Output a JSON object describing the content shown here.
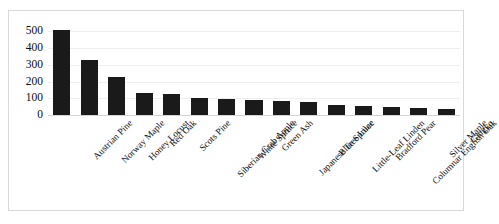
{
  "chart_data": {
    "type": "bar",
    "title": "",
    "subtitle": "",
    "xlabel": "",
    "ylabel": "",
    "ylim": [
      0,
      520
    ],
    "yticks": [
      0,
      100,
      200,
      300,
      400,
      500
    ],
    "ytick_labels": [
      "0",
      "100",
      "200",
      "300",
      "400",
      "500"
    ],
    "grid": true,
    "legend": false,
    "legend_position": "none",
    "bar_color": "#1a1a1a",
    "gridline_color": "#eeeeee",
    "plot_background": "#ffffff",
    "border_color": "#d9d9d9",
    "categories": [
      "Austrian Pine",
      "Norway Maple",
      "Honey Locust",
      "Red Oak",
      "Scots Pine",
      "Siberian Crab Apple",
      "White Spruce",
      "Green Ash",
      "Japanese Tree Lilac",
      "Blue Spruce",
      "Little-Leaf Linden",
      "Bradford Pear",
      "Columnar English Oak",
      "Silver Maple",
      "Gingko"
    ],
    "values": [
      510,
      330,
      225,
      130,
      125,
      100,
      95,
      90,
      85,
      80,
      60,
      55,
      45,
      42,
      38
    ]
  }
}
